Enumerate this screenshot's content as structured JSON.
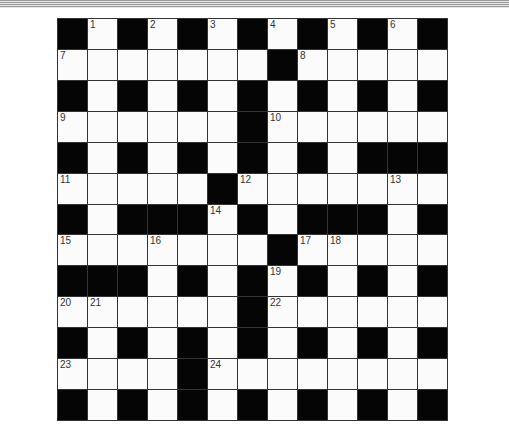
{
  "puzzle": {
    "type": "crossword",
    "size": {
      "rows": 13,
      "cols": 13
    },
    "grid": [
      "#.#.#.#.#.#.#",
      ".......#.....",
      "#.#.#.#.#.#.#",
      "......#......",
      "#.#.#.#.#.###",
      ".....#.......",
      "#.###.#.###.#",
      ".......#.....",
      "###.#.#.#.#.#",
      "......#......",
      "#.#.#.#.#.#.#",
      "....#........",
      "#.#.#.#.#.#.#"
    ],
    "numbers": [
      {
        "row": 0,
        "col": 1,
        "n": "1"
      },
      {
        "row": 0,
        "col": 3,
        "n": "2"
      },
      {
        "row": 0,
        "col": 5,
        "n": "3"
      },
      {
        "row": 0,
        "col": 7,
        "n": "4"
      },
      {
        "row": 0,
        "col": 9,
        "n": "5"
      },
      {
        "row": 0,
        "col": 11,
        "n": "6"
      },
      {
        "row": 1,
        "col": 0,
        "n": "7"
      },
      {
        "row": 1,
        "col": 8,
        "n": "8"
      },
      {
        "row": 3,
        "col": 0,
        "n": "9"
      },
      {
        "row": 3,
        "col": 7,
        "n": "10"
      },
      {
        "row": 5,
        "col": 0,
        "n": "11"
      },
      {
        "row": 5,
        "col": 6,
        "n": "12"
      },
      {
        "row": 5,
        "col": 11,
        "n": "13"
      },
      {
        "row": 6,
        "col": 5,
        "n": "14"
      },
      {
        "row": 7,
        "col": 0,
        "n": "15"
      },
      {
        "row": 7,
        "col": 3,
        "n": "16"
      },
      {
        "row": 7,
        "col": 8,
        "n": "17"
      },
      {
        "row": 7,
        "col": 9,
        "n": "18"
      },
      {
        "row": 8,
        "col": 7,
        "n": "19"
      },
      {
        "row": 9,
        "col": 0,
        "n": "20"
      },
      {
        "row": 9,
        "col": 1,
        "n": "21"
      },
      {
        "row": 9,
        "col": 7,
        "n": "22"
      },
      {
        "row": 11,
        "col": 0,
        "n": "23"
      },
      {
        "row": 11,
        "col": 5,
        "n": "24"
      }
    ]
  },
  "colors": {
    "black_cell": "#050505",
    "white_cell": "#fbfbfb",
    "grid_line": "#333333"
  }
}
